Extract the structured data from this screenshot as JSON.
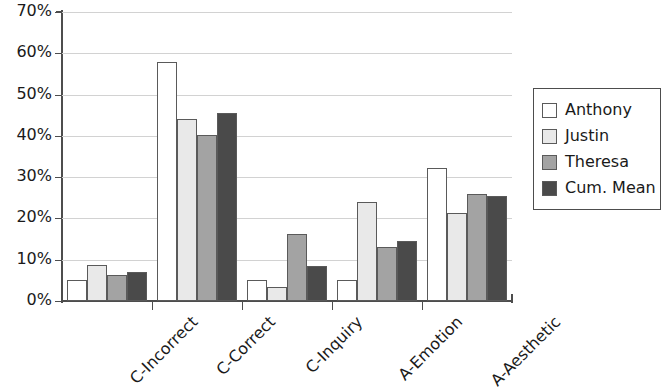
{
  "chart_data": {
    "type": "bar",
    "title": "",
    "subtitle": "",
    "xlabel": "",
    "ylabel": "",
    "categories": [
      "C-Incorrect",
      "C-Correct",
      "C-Inquiry",
      "A-Emotion",
      "A-Aesthetic"
    ],
    "series": [
      {
        "name": "Anthony",
        "color": "#ffffff",
        "values": [
          5.2,
          58.0,
          5.0,
          5.0,
          32.2
        ]
      },
      {
        "name": "Justin",
        "color": "#e9e9e9",
        "values": [
          8.8,
          44.2,
          3.5,
          24.0,
          21.2
        ]
      },
      {
        "name": "Theresa",
        "color": "#a3a3a3",
        "values": [
          6.3,
          40.2,
          16.3,
          13.2,
          26.0
        ]
      },
      {
        "name": "Cum. Mean",
        "color": "#4a4a4a",
        "values": [
          7.0,
          45.6,
          8.5,
          14.5,
          25.4
        ]
      }
    ],
    "ylim": [
      0,
      70
    ],
    "ytick_values": [
      0,
      10,
      20,
      30,
      40,
      50,
      60,
      70
    ],
    "ytick_labels": [
      "0%",
      "10%",
      "20%",
      "30%",
      "40%",
      "50%",
      "60%",
      "70%"
    ],
    "value_format": "percent",
    "grid": {
      "horizontal": true,
      "vertical": false,
      "color": "#d2d2d2"
    },
    "legend": {
      "position": "right",
      "border": true
    },
    "xtick_label_rotation": -45,
    "axis_color": "#4d4d4d",
    "bar_border_color": "#5a5a5a"
  }
}
